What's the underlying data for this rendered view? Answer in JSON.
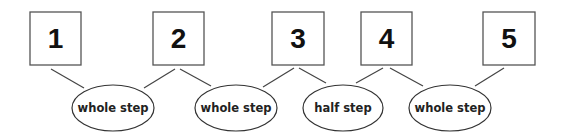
{
  "diagram": {
    "notes": [
      {
        "label": "1"
      },
      {
        "label": "2"
      },
      {
        "label": "3"
      },
      {
        "label": "4"
      },
      {
        "label": "5"
      }
    ],
    "steps": [
      {
        "label": "whole step",
        "from": 1,
        "to": 2
      },
      {
        "label": "whole step",
        "from": 2,
        "to": 3
      },
      {
        "label": "half step",
        "from": 3,
        "to": 4
      },
      {
        "label": "whole step",
        "from": 4,
        "to": 5
      }
    ]
  }
}
